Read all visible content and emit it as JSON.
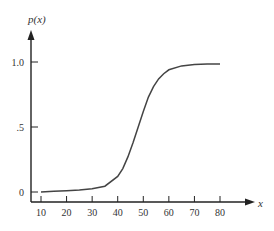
{
  "chart_data": {
    "type": "line",
    "title": "",
    "xlabel": "x",
    "ylabel": "p(x)",
    "x_ticks": [
      "10",
      "20",
      "30",
      "40",
      "50",
      "60",
      "70",
      "80"
    ],
    "y_ticks": [
      "0",
      ".5",
      "1.0"
    ],
    "xlim": [
      6,
      92
    ],
    "ylim": [
      0,
      1.1
    ],
    "grid": false,
    "legend": null,
    "series": [
      {
        "name": "p(x)",
        "x": [
          10,
          15,
          20,
          25,
          30,
          35,
          40,
          42,
          44,
          46,
          48,
          50,
          52,
          54,
          56,
          58,
          60,
          65,
          70,
          75,
          80
        ],
        "values": [
          0.0,
          0.005,
          0.01,
          0.015,
          0.025,
          0.045,
          0.12,
          0.18,
          0.27,
          0.38,
          0.5,
          0.62,
          0.73,
          0.81,
          0.87,
          0.91,
          0.94,
          0.97,
          0.98,
          0.985,
          0.985
        ]
      }
    ]
  }
}
